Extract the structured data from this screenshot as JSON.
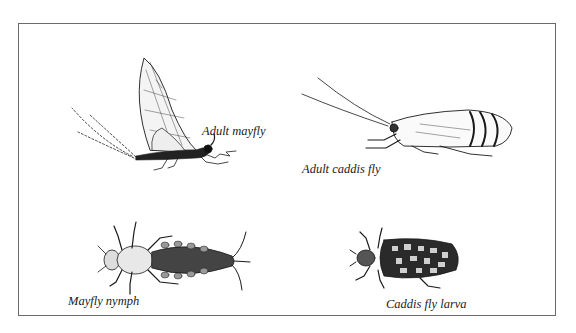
{
  "figure": {
    "panels": [
      {
        "id": "adult-mayfly",
        "label": "Adult mayfly"
      },
      {
        "id": "adult-caddis-fly",
        "label": "Adult caddis fly"
      },
      {
        "id": "mayfly-nymph",
        "label": "Mayfly nymph"
      },
      {
        "id": "caddis-fly-larva",
        "label": "Caddis fly larva"
      }
    ],
    "colors": {
      "ink": "#1a1a1a",
      "border": "#6a6a6a",
      "background": "#ffffff"
    }
  }
}
